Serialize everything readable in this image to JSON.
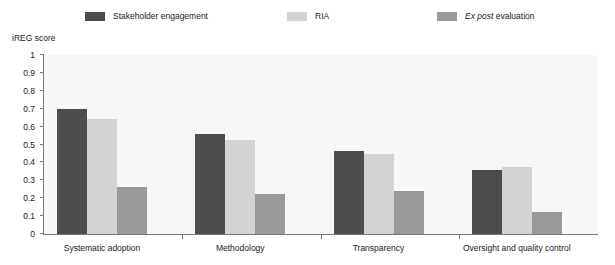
{
  "chart_data": {
    "type": "bar",
    "title": "",
    "subtitle": "",
    "xlabel": "",
    "ylabel": "iREG score",
    "ylim": [
      0,
      1
    ],
    "yticks": [
      "0",
      "0.1",
      "0.2",
      "0.3",
      "0.4",
      "0.5",
      "0.6",
      "0.7",
      "0.8",
      "0.9",
      "1"
    ],
    "grid": false,
    "legend_position": "top",
    "categories": [
      "Systematic adoption",
      "Methodology",
      "Transparency",
      "Oversight and quality control"
    ],
    "series": [
      {
        "name": "Stakeholder engagement",
        "color": "#4d4d4d",
        "values": [
          0.7,
          0.56,
          0.465,
          0.355
        ]
      },
      {
        "name": "RIA",
        "color": "#d3d3d3",
        "values": [
          0.645,
          0.525,
          0.445,
          0.375
        ]
      },
      {
        "name": "Ex post evaluation",
        "color": "#999999",
        "values": [
          0.265,
          0.225,
          0.24,
          0.125
        ]
      }
    ]
  },
  "legend": {
    "entries": [
      {
        "label": "Stakeholder engagement",
        "italic_prefix": "",
        "color": "#4d4d4d"
      },
      {
        "label": "RIA",
        "italic_prefix": "",
        "color": "#d3d3d3"
      },
      {
        "label": "evaluation",
        "italic_prefix": "Ex post",
        "color": "#999999"
      }
    ]
  },
  "colors": {
    "plot_background": "#f7f7f7",
    "page_background": "#ffffff",
    "axis": "#7a7a7a",
    "text": "#1a1a1a"
  }
}
